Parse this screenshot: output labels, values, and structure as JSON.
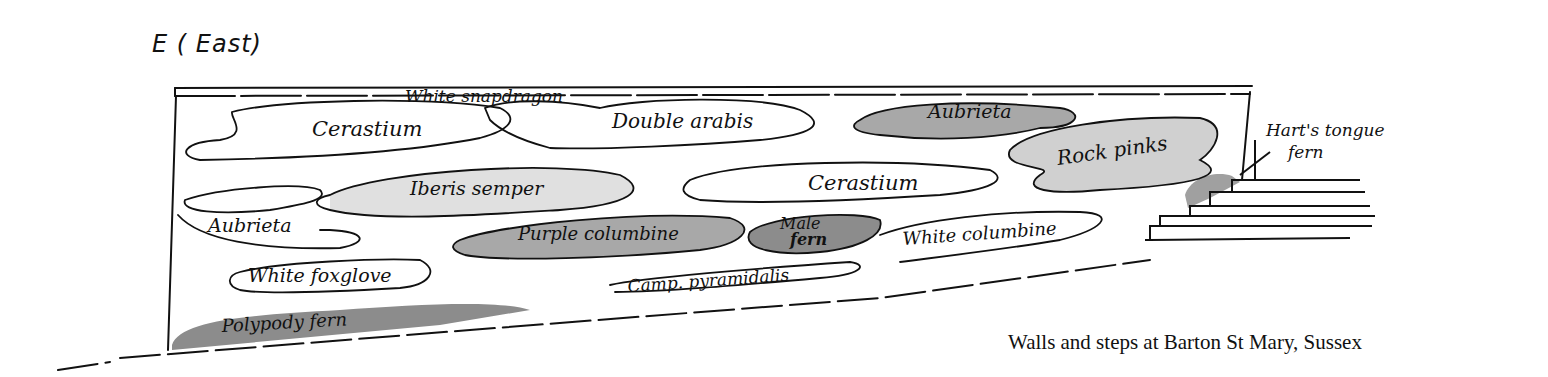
{
  "heading": "E ( East)",
  "caption": "Walls and steps at Barton St Mary, Sussex",
  "plants": [
    {
      "id": "white-snapdragon",
      "label": "White snapdragon",
      "shade": "none"
    },
    {
      "id": "cerastium-1",
      "label": "Cerastium",
      "shade": "none"
    },
    {
      "id": "double-arabis",
      "label": "Double arabis",
      "shade": "none"
    },
    {
      "id": "aubrieta-1",
      "label": "Aubrieta",
      "shade": "medium"
    },
    {
      "id": "rock-pinks",
      "label": "Rock pinks",
      "shade": "light"
    },
    {
      "id": "iberis-semper",
      "label": "Iberis semper",
      "shade": "light"
    },
    {
      "id": "cerastium-2",
      "label": "Cerastium",
      "shade": "none"
    },
    {
      "id": "aubrieta-2",
      "label": "Aubrieta",
      "shade": "none"
    },
    {
      "id": "purple-columbine",
      "label": "Purple columbine",
      "shade": "medium"
    },
    {
      "id": "male-fern",
      "label": "Male fern",
      "label_line1": "Male",
      "label_line2": "fern",
      "shade": "dark"
    },
    {
      "id": "white-columbine",
      "label": "White columbine",
      "shade": "none"
    },
    {
      "id": "white-foxglove",
      "label": "White foxglove",
      "shade": "none"
    },
    {
      "id": "camp-pyramidalis",
      "label": "Camp. pyramidalis",
      "shade": "none"
    },
    {
      "id": "polypody-fern",
      "label": "Polypody fern",
      "shade": "dark"
    }
  ],
  "harts_tongue": {
    "label_line1": "Hart's tongue",
    "label_line2": "fern"
  },
  "colors": {
    "ink": "#111111",
    "light_wash": "#d4d4d4",
    "medium_wash": "#a8a8a8",
    "dark_wash": "#8c8c8c"
  }
}
